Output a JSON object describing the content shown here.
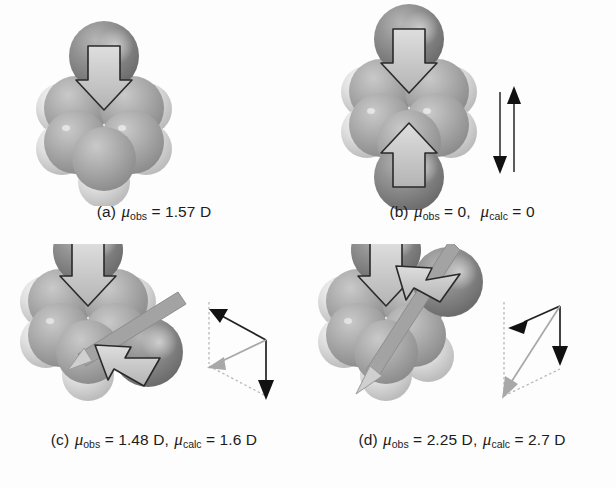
{
  "figure": {
    "background": "#fdfdfd",
    "panel_count": 4
  },
  "colors": {
    "chlorine": "#8d8d8d",
    "chlorine_dark": "#6e6e6e",
    "carbon": "#ababab",
    "carbon_dark": "#8f8f8f",
    "hydrogen": "#dcdcdc",
    "hydrogen_dark": "#bdbdbd",
    "arrow_outline": "#2a2a2a",
    "arrow_fill": "#c9c9c9",
    "resultant_gray": "#9a9a9a",
    "vector_black": "#111111",
    "vector_dotted": "#b2b2b2",
    "text": "#1c1c1c"
  },
  "panels": [
    {
      "id": "a",
      "name": "chlorobenzene",
      "label": "(a)",
      "caption_parts": {
        "label": "(a)",
        "mu1_symbol": "μ",
        "mu1_sub": "obs",
        "mu1_value": "= 1.57 D",
        "mu2_symbol": "",
        "mu2_sub": "",
        "mu2_value": ""
      },
      "caption_text": "(a) μobs = 1.57 D",
      "mu_obs": "1.57 D",
      "mu_calc": null,
      "chlorine_count": 1,
      "bond_arrows": 1,
      "has_vector_diagram": false
    },
    {
      "id": "b",
      "name": "para-dichlorobenzene",
      "label": "(b)",
      "caption_parts": {
        "label": "(b)",
        "mu1_symbol": "μ",
        "mu1_sub": "obs",
        "mu1_value": "= 0,",
        "mu2_symbol": "μ",
        "mu2_sub": "calc",
        "mu2_value": "= 0"
      },
      "caption_text": "(b) μobs = 0, μcalc = 0",
      "mu_obs": "0",
      "mu_calc": "0",
      "chlorine_count": 2,
      "bond_arrows": 2,
      "has_vector_diagram": true,
      "vector_diagram": "two antiparallel arrows of equal length that cancel"
    },
    {
      "id": "c",
      "name": "meta-dichlorobenzene",
      "label": "(c)",
      "caption_parts": {
        "label": "(c)",
        "mu1_symbol": "μ",
        "mu1_sub": "obs",
        "mu1_value": "= 1.48 D,",
        "mu2_symbol": "μ",
        "mu2_sub": "calc",
        "mu2_value": "= 1.6 D"
      },
      "caption_text": "(c) μobs = 1.48 D, μcalc = 1.6 D",
      "mu_obs": "1.48 D",
      "mu_calc": "1.6 D",
      "chlorine_count": 2,
      "bond_arrows": 2,
      "has_vector_diagram": true,
      "vector_diagram": "parallelogram of two vectors 120 degrees apart with gray resultant"
    },
    {
      "id": "d",
      "name": "ortho-dichlorobenzene",
      "label": "(d)",
      "caption_parts": {
        "label": "(d)",
        "mu1_symbol": "μ",
        "mu1_sub": "obs",
        "mu1_value": "= 2.25 D,",
        "mu2_symbol": "μ",
        "mu2_sub": "calc",
        "mu2_value": "= 2.7 D"
      },
      "caption_text": "(d) μobs = 2.25 D, μcalc = 2.7 D",
      "mu_obs": "2.25 D",
      "mu_calc": "2.7 D",
      "chlorine_count": 2,
      "bond_arrows": 2,
      "has_vector_diagram": true,
      "vector_diagram": "narrow parallelogram of two vectors 60 degrees apart with long gray resultant"
    }
  ]
}
